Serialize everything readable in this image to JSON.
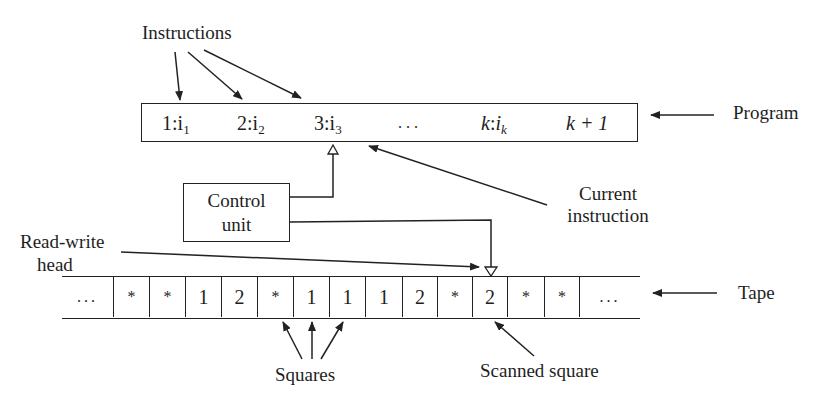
{
  "labels": {
    "instructions": "Instructions",
    "program": "Program",
    "control_unit_line1": "Control",
    "control_unit_line2": "unit",
    "current_instruction_line1": "Current",
    "current_instruction_line2": "instruction",
    "read_write_head_line1": "Read-write",
    "read_write_head_line2": "head",
    "tape": "Tape",
    "squares": "Squares",
    "scanned_square": "Scanned square"
  },
  "program": {
    "items": [
      {
        "num": "1:",
        "var": "i",
        "sub": "1"
      },
      {
        "num": "2:",
        "var": "i",
        "sub": "2"
      },
      {
        "num": "3:",
        "var": "i",
        "sub": "3"
      },
      {
        "text": ". . ."
      },
      {
        "num": "k",
        "sep": ":",
        "var": "i",
        "sub": "k"
      },
      {
        "text": "k + 1"
      }
    ]
  },
  "tape": {
    "cells": [
      "...",
      "*",
      "*",
      "1",
      "2",
      "*",
      "1",
      "1",
      "1",
      "2",
      "*",
      "2",
      "*",
      "*",
      "..."
    ],
    "scanned_index": 11
  },
  "colors": {
    "ink": "#1e1e1e",
    "background": "#ffffff"
  }
}
